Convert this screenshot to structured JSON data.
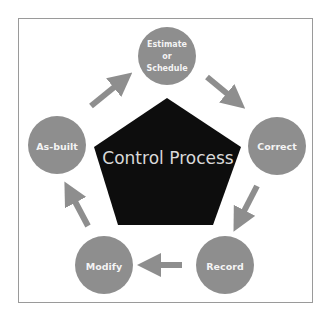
{
  "diagram": {
    "title": "Control Process",
    "center_shape": "pentagon",
    "colors": {
      "node_fill": "#8e8e8e",
      "node_text": "#ffffff",
      "center_fill": "#0d0d0d",
      "center_text": "#d9d9d9",
      "arrow": "#8e8e8e",
      "frame_border": "#9a9a9a"
    },
    "nodes": [
      {
        "id": "estimate",
        "lines": [
          "Estimate",
          "or",
          "Schedule"
        ]
      },
      {
        "id": "correct",
        "lines": [
          "Correct"
        ]
      },
      {
        "id": "record",
        "lines": [
          "Record"
        ]
      },
      {
        "id": "modify",
        "lines": [
          "Modify"
        ]
      },
      {
        "id": "as-built",
        "lines": [
          "As-built"
        ]
      }
    ],
    "edges": [
      {
        "from": "estimate",
        "to": "correct"
      },
      {
        "from": "correct",
        "to": "record"
      },
      {
        "from": "record",
        "to": "modify"
      },
      {
        "from": "modify",
        "to": "as-built"
      },
      {
        "from": "as-built",
        "to": "estimate"
      }
    ]
  }
}
